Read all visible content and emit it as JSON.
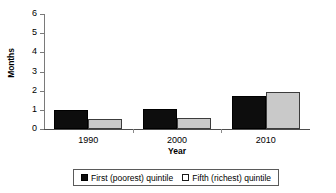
{
  "chart_data": {
    "type": "bar",
    "title": "",
    "xlabel": "Year",
    "ylabel": "Months",
    "categories": [
      "1990",
      "2000",
      "2010"
    ],
    "series": [
      {
        "name": "First (poorest) quintile",
        "color": "#0d0d0d",
        "values": [
          1.0,
          1.05,
          1.7
        ]
      },
      {
        "name": "Fifth (richest) quintile",
        "color": "#c9c9c9",
        "values": [
          0.5,
          0.55,
          1.95
        ]
      }
    ],
    "ylim": [
      0,
      6
    ],
    "yticks": [
      "0",
      "1",
      "2",
      "3",
      "4",
      "5",
      "6"
    ],
    "grid": false,
    "legend_position": "bottom"
  },
  "legend": {
    "entries": [
      {
        "label": "First (poorest) quintile",
        "swatch": "filled-black-square"
      },
      {
        "label": "Fifth (richest) quintile",
        "swatch": "outlined-white-square"
      }
    ]
  }
}
